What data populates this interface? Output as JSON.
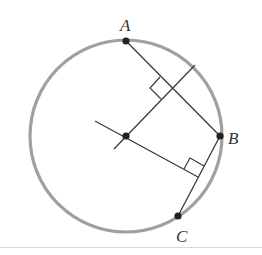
{
  "diagram": {
    "type": "geometry-circle-chord-bisectors",
    "colors": {
      "circle": "#a0a0a0",
      "lines": "#3a3a3a",
      "points": "#222222",
      "labels": "#333333"
    },
    "circle": {
      "cx": 126,
      "cy": 136,
      "r": 96
    },
    "points": [
      {
        "name": "A",
        "x": 126,
        "y": 41,
        "label_x": 120,
        "label_y": 31
      },
      {
        "name": "B",
        "x": 220,
        "y": 136,
        "label_x": 228,
        "label_y": 144
      },
      {
        "name": "C",
        "x": 178,
        "y": 216,
        "label_x": 176,
        "label_y": 242
      },
      {
        "name": "O",
        "x": 126,
        "y": 136
      }
    ],
    "labels": {
      "A": "A",
      "B": "B",
      "C": "C"
    },
    "chords": [
      {
        "from": "A",
        "to": "B"
      },
      {
        "from": "B",
        "to": "C"
      }
    ],
    "bisectors": [
      {
        "of": "AB",
        "x1": 114,
        "y1": 149,
        "x2": 195,
        "y2": 65
      },
      {
        "of": "BC",
        "x1": 95,
        "y1": 121,
        "x2": 198,
        "y2": 177
      }
    ],
    "right_angle_marks": [
      {
        "at": "midpoint-AB",
        "x": 173,
        "y": 88
      },
      {
        "at": "midpoint-BC",
        "x": 199,
        "y": 176
      }
    ]
  }
}
